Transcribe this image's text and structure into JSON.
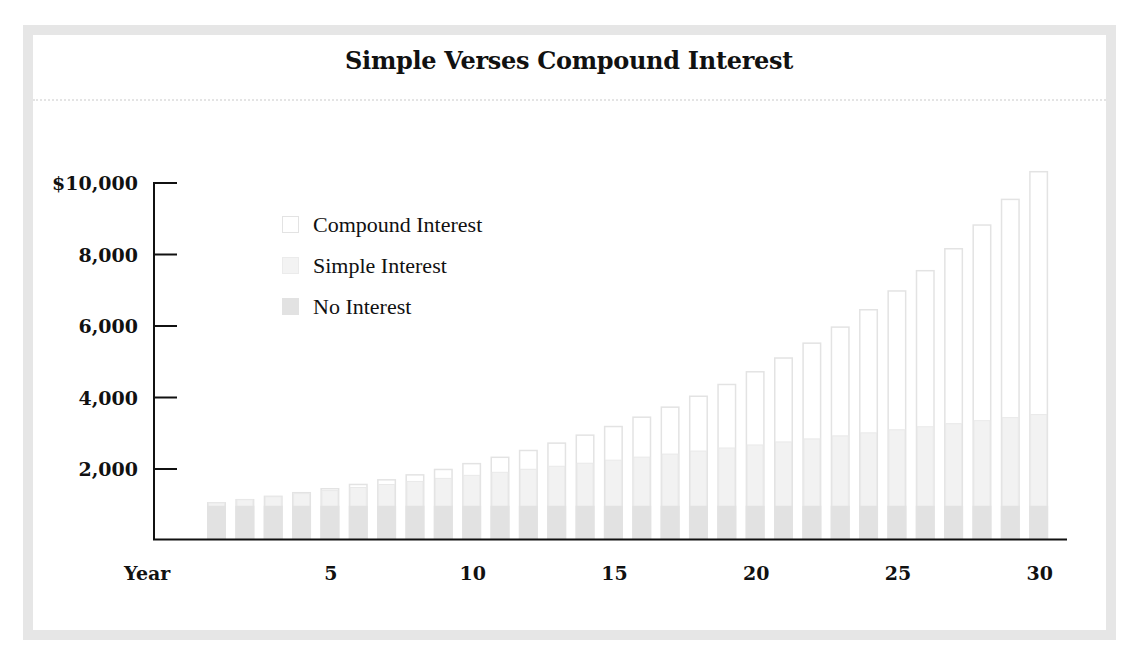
{
  "chart_data": {
    "type": "bar",
    "stacked": true,
    "title": "Simple Verses Compound Interest",
    "xlabel": "Year",
    "ylabel": "",
    "ylim": [
      0,
      10000
    ],
    "yticks": [
      {
        "value": 10000,
        "label": "$10,000"
      },
      {
        "value": 8000,
        "label": "8,000"
      },
      {
        "value": 6000,
        "label": "6,000"
      },
      {
        "value": 4000,
        "label": "4,000"
      },
      {
        "value": 2000,
        "label": "2,000"
      }
    ],
    "xticks": [
      {
        "value": 5,
        "label": "5"
      },
      {
        "value": 10,
        "label": "10"
      },
      {
        "value": 15,
        "label": "15"
      },
      {
        "value": 20,
        "label": "20"
      },
      {
        "value": 25,
        "label": "25"
      },
      {
        "value": 30,
        "label": "30"
      }
    ],
    "categories": [
      1,
      2,
      3,
      4,
      5,
      6,
      7,
      8,
      9,
      10,
      11,
      12,
      13,
      14,
      15,
      16,
      17,
      18,
      19,
      20,
      21,
      22,
      23,
      24,
      25,
      26,
      27,
      28,
      29,
      30
    ],
    "series": [
      {
        "name": "No Interest",
        "color": "#e2e2e2",
        "values": [
          1000,
          1000,
          1000,
          1000,
          1000,
          1000,
          1000,
          1000,
          1000,
          1000,
          1000,
          1000,
          1000,
          1000,
          1000,
          1000,
          1000,
          1000,
          1000,
          1000,
          1000,
          1000,
          1000,
          1000,
          1000,
          1000,
          1000,
          1000,
          1000,
          1000
        ]
      },
      {
        "name": "Simple Interest",
        "color": "#f1f1f1",
        "totals": [
          1085,
          1170,
          1255,
          1340,
          1425,
          1510,
          1595,
          1680,
          1765,
          1850,
          1935,
          2020,
          2105,
          2190,
          2275,
          2360,
          2445,
          2530,
          2615,
          2700,
          2785,
          2870,
          2955,
          3040,
          3125,
          3210,
          3295,
          3380,
          3465,
          3550
        ]
      },
      {
        "name": "Compound Interest",
        "color": "#ffffff",
        "totals": [
          1081,
          1169,
          1263,
          1365,
          1476,
          1595,
          1725,
          1864,
          2015,
          2178,
          2355,
          2546,
          2752,
          2975,
          3216,
          3477,
          3758,
          4063,
          4392,
          4747,
          5132,
          5548,
          5997,
          6483,
          7008,
          7575,
          8189,
          8852,
          9569,
          10344
        ]
      }
    ],
    "legend": {
      "position": "upper-left-inside",
      "entries": [
        "Compound Interest",
        "Simple Interest",
        "No Interest"
      ]
    },
    "grid": false
  },
  "legend": {
    "items": [
      {
        "label": "Compound Interest",
        "fill": "#ffffff",
        "stroke": "#e3e3e3"
      },
      {
        "label": "Simple Interest",
        "fill": "#f3f3f3",
        "stroke": "#ebebeb"
      },
      {
        "label": "No Interest",
        "fill": "#e2e2e2",
        "stroke": "#e2e2e2"
      }
    ]
  },
  "colors": {
    "frame": "#e6e6e6",
    "axis": "#111111",
    "no_interest": "#e2e2e2",
    "simple_interest": "#f1f1f1",
    "compound_outline": "#e3e3e3"
  }
}
